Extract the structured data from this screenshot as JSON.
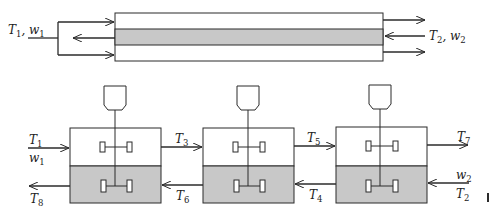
{
  "figure": {
    "colors": {
      "line": "#2b2b2b",
      "shaded": "#c8c8c8",
      "background": "#ffffff"
    },
    "top_exchanger": {
      "description": "Countercurrent double-pipe heat exchanger",
      "inlet_left": {
        "var1": "T",
        "sub1": "1",
        "sep": ", ",
        "var2": "w",
        "sub2": "1"
      },
      "inlet_right": {
        "var1": "T",
        "sub1": "2",
        "sep": ", ",
        "var2": "w",
        "sub2": "2"
      }
    },
    "stages": {
      "description": "Three mixer-settler stages in countercurrent series",
      "labels": {
        "T1": {
          "var": "T",
          "sub": "1"
        },
        "w1": {
          "var": "w",
          "sub": "1"
        },
        "T3": {
          "var": "T",
          "sub": "3"
        },
        "T5": {
          "var": "T",
          "sub": "5"
        },
        "T7": {
          "var": "T",
          "sub": "7"
        },
        "T8": {
          "var": "T",
          "sub": "8"
        },
        "T6": {
          "var": "T",
          "sub": "6"
        },
        "T4": {
          "var": "T",
          "sub": "4"
        },
        "w2": {
          "var": "w",
          "sub": "2"
        },
        "T2": {
          "var": "T",
          "sub": "2"
        }
      }
    }
  }
}
